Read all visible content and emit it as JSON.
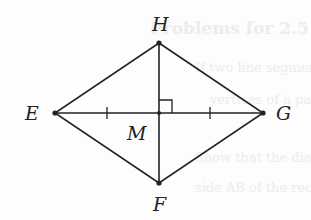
{
  "figure": {
    "type": "rhombus with diagonals",
    "points": {
      "H": {
        "label": "H",
        "x": 159,
        "y": 43
      },
      "E": {
        "label": "E",
        "x": 55,
        "y": 113
      },
      "G": {
        "label": "G",
        "x": 263,
        "y": 113
      },
      "F": {
        "label": "F",
        "x": 159,
        "y": 183
      },
      "M": {
        "label": "M",
        "x": 159,
        "y": 113
      }
    },
    "annotations": {
      "right_angle_at": "M",
      "tick_marks": [
        "EM",
        "MG"
      ]
    },
    "colors": {
      "stroke": "#222222",
      "background": "#fdfdfd",
      "ghost_text": "#ececec"
    }
  },
  "ghost_text": [
    "Problems for 2.5",
    "If two line segments a",
    "vertices of a parallelogr",
    "Show that the diagonals",
    "side AB of the rectangle"
  ]
}
